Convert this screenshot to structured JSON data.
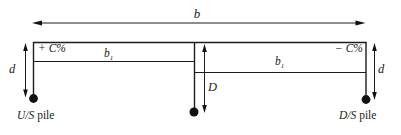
{
  "diagram": {
    "dimensions": {
      "overall_width": "b",
      "left_panel_width": {
        "base": "b",
        "sub": "1"
      },
      "right_panel_width": {
        "base": "b",
        "sub": "1"
      },
      "left_pile_depth": "d",
      "right_pile_depth": "d",
      "middle_pile_depth": "D"
    },
    "annotations": {
      "left_correction": "+ C%",
      "right_correction": "− C%"
    },
    "captions": {
      "us_pile": {
        "abbr": "U/S",
        "word": " pile"
      },
      "ds_pile": {
        "abbr": "D/S",
        "word": " pile"
      }
    },
    "colors": {
      "line": "#1c1c1c",
      "dot": "#111111",
      "text": "#1c1c1c",
      "background": "#ffffff"
    }
  }
}
